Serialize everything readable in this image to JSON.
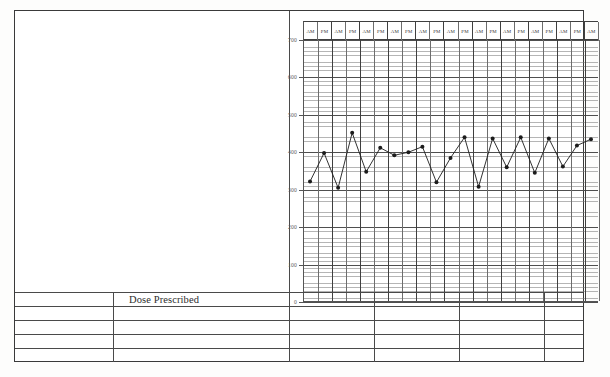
{
  "document": {
    "kind": "clinical-observation-chart",
    "dose_label": "Dose Prescribed",
    "bottom_partial_text": ""
  },
  "chart_data": {
    "type": "line",
    "title": "",
    "xlabel": "",
    "ylabel": "",
    "ylim": [
      0,
      700
    ],
    "ytick_labels": [
      "0",
      "100",
      "200",
      "300",
      "400",
      "500",
      "600",
      "700"
    ],
    "yticks": [
      0,
      100,
      200,
      300,
      400,
      500,
      600,
      700
    ],
    "grid": true,
    "legend": false,
    "period_labels": [
      "AM",
      "PM"
    ],
    "n_periods": 21,
    "x": [
      1,
      2,
      3,
      4,
      5,
      6,
      7,
      8,
      9,
      10,
      11,
      12,
      13,
      14,
      15,
      16,
      17,
      18,
      19,
      20,
      21
    ],
    "x_tick_labels": [
      "AM",
      "PM",
      "AM",
      "PM",
      "AM",
      "PM",
      "AM",
      "PM",
      "AM",
      "PM",
      "AM",
      "PM",
      "AM",
      "PM",
      "AM",
      "PM",
      "AM",
      "PM",
      "AM",
      "PM",
      "AM"
    ],
    "series": [
      {
        "name": "Observation",
        "marker": "filled-circle",
        "color": "#1c1c1c",
        "values": [
          322,
          398,
          305,
          452,
          348,
          412,
          392,
          400,
          415,
          320,
          385,
          440,
          308,
          437,
          360,
          440,
          345,
          437,
          362,
          418,
          435
        ]
      }
    ]
  },
  "layout": {
    "left_block_empty": true,
    "lower_table_rows": 5,
    "lower_table_columns": 3,
    "frame_color": "#3a3a3a",
    "grid_color": "#6d6d6d",
    "major_grid_color": "#4f4f4f",
    "ink_color": "#1c1c1c"
  }
}
